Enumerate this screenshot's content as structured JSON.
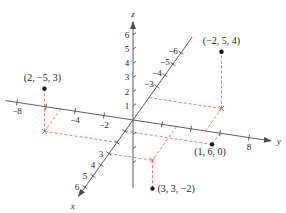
{
  "diagram": {
    "colors": {
      "axis": "#4d4d4f",
      "guide": "#e8574a",
      "point": "#111111",
      "text": "#231f20"
    },
    "projection": {
      "origin_px": [
        133,
        120
      ],
      "x_unit_px": [
        -8.0,
        11.2
      ],
      "y_unit_px": [
        14.5,
        2.2
      ],
      "z_unit_px": [
        0,
        -14.2
      ]
    },
    "axes": {
      "x": {
        "name": "x",
        "ticks_shown": [
          -6,
          -5,
          -4,
          -3,
          1,
          2,
          3,
          4,
          5,
          6
        ],
        "labels": [
          {
            "value": -6,
            "text": "−6"
          },
          {
            "value": -5,
            "text": "−5"
          },
          {
            "value": -4,
            "text": "−4"
          },
          {
            "value": -3,
            "text": "−3"
          },
          {
            "value": 3,
            "text": "3"
          },
          {
            "value": 4,
            "text": "4"
          },
          {
            "value": 5,
            "text": "5"
          },
          {
            "value": 6,
            "text": "6"
          }
        ]
      },
      "y": {
        "name": "y",
        "ticks_shown": [
          -8,
          -6,
          -4,
          -2,
          2,
          4,
          6,
          8
        ],
        "labels": [
          {
            "value": -8,
            "text": "−8"
          },
          {
            "value": -4,
            "text": "−4"
          },
          {
            "value": -2,
            "text": "−2"
          },
          {
            "value": 8,
            "text": "8"
          }
        ]
      },
      "z": {
        "name": "z",
        "ticks_shown": [
          -3,
          -2,
          -1,
          1,
          2,
          3,
          4,
          5,
          6
        ],
        "labels": [
          {
            "value": 1,
            "text": "1"
          },
          {
            "value": 2,
            "text": "2"
          },
          {
            "value": 3,
            "text": "3"
          },
          {
            "value": 4,
            "text": "4"
          },
          {
            "value": 5,
            "text": "5"
          },
          {
            "value": 6,
            "text": "6"
          }
        ]
      }
    },
    "points": [
      {
        "coords": [
          2,
          -5,
          3
        ],
        "label": "(2, −5, 3)"
      },
      {
        "coords": [
          -2,
          5,
          4
        ],
        "label": "(−2, 5, 4)"
      },
      {
        "coords": [
          1,
          6,
          0
        ],
        "label": "(1, 6, 0)"
      },
      {
        "coords": [
          3,
          3,
          -2
        ],
        "label": "(3, 3, −2)"
      }
    ]
  }
}
